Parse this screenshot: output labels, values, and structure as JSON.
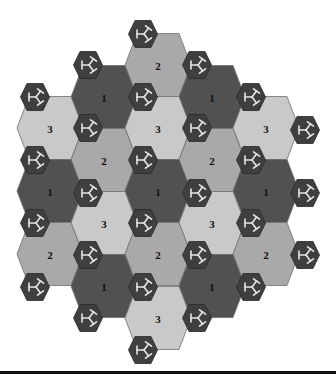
{
  "diagram": {
    "colors": {
      "type_1": "#515151",
      "type_2": "#a9a9a9",
      "type_3": "#c9c9c9",
      "node_fill": "#3f3f3f",
      "glyph": "#e6e6e6",
      "rule": "#111111"
    },
    "tiles": [
      {
        "x": 158,
        "y": 65,
        "label": "2"
      },
      {
        "x": 104,
        "y": 97,
        "label": "1"
      },
      {
        "x": 212,
        "y": 97,
        "label": "1"
      },
      {
        "x": 50,
        "y": 128,
        "label": "3"
      },
      {
        "x": 158,
        "y": 128,
        "label": "3"
      },
      {
        "x": 266,
        "y": 128,
        "label": "3"
      },
      {
        "x": 104,
        "y": 160,
        "label": "2"
      },
      {
        "x": 212,
        "y": 160,
        "label": "2"
      },
      {
        "x": 50,
        "y": 191,
        "label": "1"
      },
      {
        "x": 158,
        "y": 191,
        "label": "1"
      },
      {
        "x": 266,
        "y": 191,
        "label": "1"
      },
      {
        "x": 104,
        "y": 223,
        "label": "3"
      },
      {
        "x": 212,
        "y": 223,
        "label": "3"
      },
      {
        "x": 50,
        "y": 254,
        "label": "2"
      },
      {
        "x": 158,
        "y": 254,
        "label": "2"
      },
      {
        "x": 266,
        "y": 254,
        "label": "2"
      },
      {
        "x": 104,
        "y": 286,
        "label": "1"
      },
      {
        "x": 212,
        "y": 286,
        "label": "1"
      },
      {
        "x": 158,
        "y": 318,
        "label": "3"
      }
    ],
    "nodes": [
      {
        "x": 143,
        "y": 34
      },
      {
        "x": 88,
        "y": 65
      },
      {
        "x": 197,
        "y": 65
      },
      {
        "x": 35,
        "y": 97
      },
      {
        "x": 143,
        "y": 97
      },
      {
        "x": 251,
        "y": 97
      },
      {
        "x": 88,
        "y": 128
      },
      {
        "x": 197,
        "y": 128
      },
      {
        "x": 305,
        "y": 130
      },
      {
        "x": 35,
        "y": 160
      },
      {
        "x": 143,
        "y": 160
      },
      {
        "x": 251,
        "y": 160
      },
      {
        "x": 88,
        "y": 193
      },
      {
        "x": 197,
        "y": 193
      },
      {
        "x": 305,
        "y": 193
      },
      {
        "x": 35,
        "y": 223
      },
      {
        "x": 143,
        "y": 223
      },
      {
        "x": 251,
        "y": 223
      },
      {
        "x": 88,
        "y": 255
      },
      {
        "x": 197,
        "y": 255
      },
      {
        "x": 305,
        "y": 255
      },
      {
        "x": 35,
        "y": 287
      },
      {
        "x": 143,
        "y": 287
      },
      {
        "x": 251,
        "y": 287
      },
      {
        "x": 88,
        "y": 318
      },
      {
        "x": 197,
        "y": 318
      },
      {
        "x": 143,
        "y": 350
      }
    ],
    "node_icon": "trivalent-junction-icon"
  }
}
